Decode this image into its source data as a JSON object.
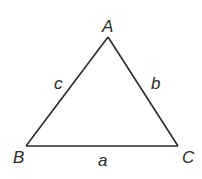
{
  "diagram": {
    "type": "triangle",
    "stroke_color": "#2a2a2a",
    "background": "#ffffff",
    "vertices": {
      "A": {
        "label": "A",
        "x": 108,
        "y": 37
      },
      "B": {
        "label": "B",
        "x": 26,
        "y": 146
      },
      "C": {
        "label": "C",
        "x": 178,
        "y": 146
      }
    },
    "sides": {
      "a": {
        "label": "a",
        "between": "B-C"
      },
      "b": {
        "label": "b",
        "between": "A-C"
      },
      "c": {
        "label": "c",
        "between": "A-B"
      }
    }
  }
}
